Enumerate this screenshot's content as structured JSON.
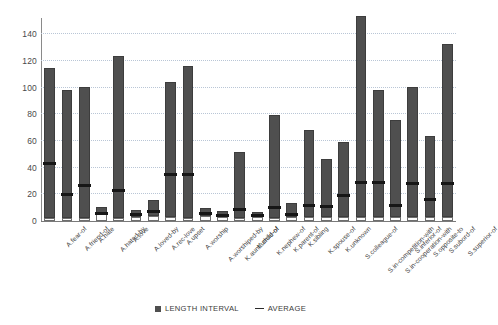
{
  "chart_data": {
    "type": "bar",
    "title": "",
    "subtitle": "",
    "xlabel": "",
    "ylabel": "",
    "ylim": [
      0,
      150
    ],
    "yticks": [
      0,
      20,
      40,
      60,
      80,
      100,
      120,
      140
    ],
    "grid": true,
    "legend_position": "bottom",
    "legend": [
      {
        "label": "LENGTH INTERVAL",
        "marker": "square",
        "color": "#4f4f4f"
      },
      {
        "label": "AVERAGE",
        "marker": "line",
        "color": "#2b2b2b"
      }
    ],
    "categories": [
      "A.fear-of",
      "A.friend-of",
      "A.hate",
      "A.hated-by",
      "A.love",
      "A.loved-by",
      "A.rec-love",
      "A.upset",
      "A.worship",
      "A.worshiped-by",
      "K.aunt/uncle-of",
      "K.child-of",
      "K.nephew-of",
      "K.parent-of",
      "K.sibling",
      "K.spouse-of",
      "K.unknown",
      "S.colleague-of",
      "S.in-competition-with",
      "S.in-cooperation-with",
      "S.inferior-of",
      "S.opposite-to",
      "S.subord-of",
      "S.superior-of"
    ],
    "series": [
      {
        "name": "LENGTH INTERVAL",
        "type": "floating-bar",
        "low": [
          2,
          2,
          2,
          5,
          2,
          3,
          4,
          3,
          2,
          4,
          3,
          2,
          3,
          2,
          3,
          3,
          3,
          3,
          3,
          3,
          3,
          3,
          3,
          3
        ],
        "high": [
          113,
          97,
          99,
          9,
          122,
          7,
          14,
          103,
          115,
          8,
          6,
          50,
          5,
          78,
          12,
          67,
          45,
          58,
          152,
          97,
          74,
          99,
          62,
          131
        ]
      },
      {
        "name": "AVERAGE",
        "type": "marker",
        "values": [
          43,
          20,
          27,
          6,
          23,
          5,
          7,
          35,
          35,
          6,
          4,
          9,
          4,
          10,
          5,
          12,
          11,
          19,
          29,
          29,
          12,
          28,
          16,
          28
        ]
      }
    ]
  }
}
